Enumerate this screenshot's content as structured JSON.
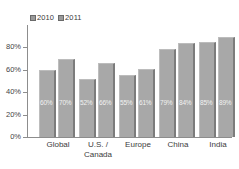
{
  "chart_data": {
    "type": "bar",
    "title": "",
    "subtitle": "",
    "xlabel": "",
    "ylabel": "",
    "ylim": [
      0,
      100
    ],
    "grid": false,
    "legend_position": "top-left",
    "categories": [
      "Global",
      "U.S. /\nCanada",
      "Europe",
      "China",
      "India"
    ],
    "ytick_labels": [
      "0%",
      "20%",
      "40%",
      "60%",
      "80%"
    ],
    "ytick_values": [
      0,
      20,
      40,
      60,
      80
    ],
    "series": [
      {
        "name": "2010",
        "color": "#a8a8a8",
        "values": [
          60,
          52,
          55,
          79,
          85
        ],
        "labels": [
          "60%",
          "52%",
          "55%",
          "79%",
          "85%"
        ]
      },
      {
        "name": "2011",
        "color": "#a8a8a8",
        "values": [
          70,
          66,
          61,
          84,
          89
        ],
        "labels": [
          "70%",
          "66%",
          "61%",
          "84%",
          "89%"
        ]
      }
    ]
  },
  "legend": {
    "items": [
      {
        "label": "2010",
        "swatch": "legend-swatch-2010"
      },
      {
        "label": "2011",
        "swatch": "legend-swatch-2011"
      }
    ]
  },
  "colors": {
    "bar_fill": "#a8a8a8",
    "bar_shadow": "#7c7c7c",
    "axis": "#8d8d8d",
    "label_text": "#3c3c3c",
    "value_text": "#f2f2f2",
    "background": "#ffffff"
  }
}
